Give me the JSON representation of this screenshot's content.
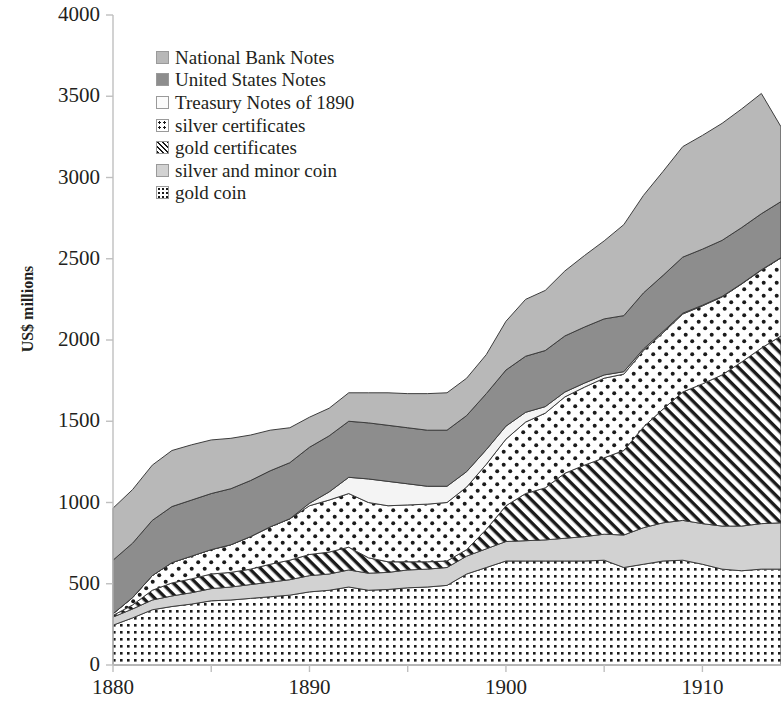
{
  "chart_data": {
    "type": "area",
    "title": "",
    "subtitle": "",
    "xlabel": "",
    "ylabel": "US$ millions",
    "stacked": true,
    "grid": false,
    "legend_position": "top-left-inside",
    "xlim": [
      1880,
      1914
    ],
    "ylim": [
      0,
      4000
    ],
    "y_ticks": [
      0,
      500,
      1000,
      1500,
      2000,
      2500,
      3000,
      3500,
      4000
    ],
    "y_tick_labels": [
      "0",
      "500",
      "1000",
      "1500",
      "2000",
      "2500",
      "3000",
      "3500",
      "4000"
    ],
    "x_ticks": [
      1880,
      1890,
      1900,
      1910
    ],
    "x_tick_labels": [
      "1880",
      "1890",
      "1900",
      "1910"
    ],
    "x_minor_tick_interval": 5,
    "x": [
      1880,
      1881,
      1882,
      1883,
      1884,
      1885,
      1886,
      1887,
      1888,
      1889,
      1890,
      1891,
      1892,
      1893,
      1894,
      1895,
      1896,
      1897,
      1898,
      1899,
      1900,
      1901,
      1902,
      1903,
      1904,
      1905,
      1906,
      1907,
      1908,
      1909,
      1910,
      1911,
      1912,
      1913,
      1914
    ],
    "series": [
      {
        "name": "gold coin",
        "swatch": "dense-dot",
        "fill": "#ffffff",
        "pattern": "dense dots on white",
        "values": [
          245,
          290,
          340,
          360,
          375,
          395,
          400,
          410,
          420,
          430,
          450,
          460,
          480,
          460,
          465,
          475,
          480,
          490,
          560,
          600,
          640,
          640,
          640,
          640,
          640,
          645,
          600,
          620,
          640,
          645,
          620,
          590,
          580,
          590,
          590
        ]
      },
      {
        "name": "silver and minor coin",
        "swatch": "light-gray-solid",
        "fill": "#d2d2d2",
        "pattern": "solid light gray",
        "values": [
          50,
          55,
          60,
          65,
          70,
          75,
          80,
          85,
          90,
          95,
          100,
          100,
          105,
          105,
          105,
          110,
          110,
          110,
          110,
          115,
          120,
          125,
          130,
          140,
          150,
          160,
          200,
          225,
          235,
          245,
          250,
          265,
          275,
          280,
          285
        ]
      },
      {
        "name": "gold certificates",
        "swatch": "diagonal-hatch",
        "fill": "#ffffff",
        "pattern": "diagonal hatch lines",
        "values": [
          10,
          25,
          60,
          80,
          85,
          90,
          90,
          95,
          110,
          120,
          130,
          135,
          140,
          95,
          65,
          50,
          45,
          40,
          40,
          120,
          220,
          290,
          320,
          400,
          440,
          470,
          520,
          620,
          700,
          790,
          860,
          930,
          1010,
          1080,
          1150
        ]
      },
      {
        "name": "silver certificates",
        "swatch": "sparse-dot",
        "fill": "#ffffff",
        "pattern": "sparse dots on white",
        "values": [
          10,
          45,
          90,
          125,
          140,
          150,
          170,
          200,
          230,
          255,
          300,
          320,
          330,
          340,
          345,
          350,
          355,
          360,
          385,
          400,
          410,
          440,
          460,
          470,
          480,
          490,
          470,
          470,
          470,
          480,
          480,
          480,
          480,
          480,
          480
        ]
      },
      {
        "name": "Treasury Notes of 1890",
        "swatch": "white-outline",
        "fill": "#f2f2f2",
        "pattern": "white / very light",
        "values": [
          0,
          0,
          0,
          0,
          0,
          0,
          0,
          0,
          0,
          0,
          15,
          50,
          100,
          145,
          150,
          130,
          110,
          100,
          95,
          90,
          80,
          60,
          40,
          30,
          25,
          20,
          15,
          10,
          8,
          5,
          4,
          3,
          2,
          2,
          2
        ]
      },
      {
        "name": "United States Notes",
        "swatch": "dark-gray-solid",
        "fill": "#8d8d8d",
        "pattern": "solid dark gray",
        "values": [
          330,
          335,
          340,
          345,
          345,
          345,
          345,
          345,
          345,
          345,
          345,
          345,
          345,
          345,
          345,
          345,
          345,
          345,
          345,
          345,
          345,
          345,
          345,
          345,
          345,
          345,
          345,
          345,
          345,
          345,
          345,
          345,
          345,
          345,
          345
        ]
      },
      {
        "name": "National Bank Notes",
        "swatch": "medium-gray-solid",
        "fill": "#b8b8b8",
        "pattern": "solid medium gray",
        "values": [
          320,
          330,
          340,
          345,
          340,
          330,
          310,
          280,
          250,
          215,
          185,
          170,
          175,
          185,
          200,
          210,
          225,
          230,
          230,
          240,
          300,
          350,
          370,
          400,
          440,
          480,
          560,
          600,
          640,
          680,
          700,
          720,
          730,
          740,
          460
        ]
      }
    ]
  },
  "legend": {
    "items": [
      {
        "label": "National Bank Notes",
        "swatch": "medium-gray-solid"
      },
      {
        "label": "United States Notes",
        "swatch": "dark-gray-solid"
      },
      {
        "label": "Treasury Notes of 1890",
        "swatch": "white-outline"
      },
      {
        "label": "silver certificates",
        "swatch": "sparse-dot"
      },
      {
        "label": "gold certificates",
        "swatch": "diagonal-hatch"
      },
      {
        "label": "silver and minor coin",
        "swatch": "light-gray-solid"
      },
      {
        "label": "gold coin",
        "swatch": "dense-dot"
      }
    ]
  },
  "colors": {
    "national_bank_notes": "#b8b8b8",
    "united_states_notes": "#8d8d8d",
    "treasury_notes_1890": "#f2f2f2",
    "silver_certificates": "#ffffff",
    "gold_certificates": "#ffffff",
    "silver_and_minor_coin": "#d2d2d2",
    "gold_coin": "#ffffff",
    "axis": "#bfbfbf",
    "text": "#231f20",
    "outline": "#3a3a3a"
  }
}
